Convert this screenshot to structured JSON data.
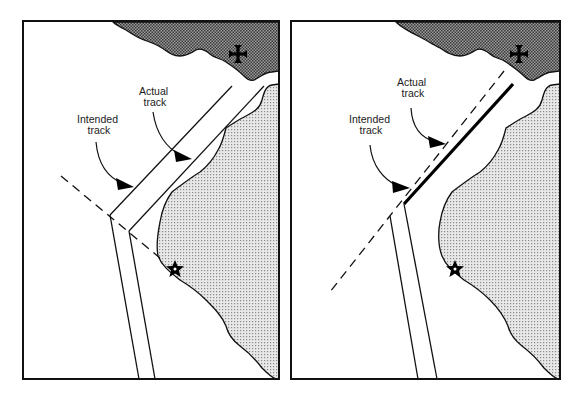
{
  "figure": {
    "panels": [
      {
        "id": "left",
        "labels": {
          "actual": [
            "Actual",
            "track"
          ],
          "intended": [
            "Intended",
            "track"
          ]
        },
        "symbols": [
          "cross-landmark",
          "star-landmark"
        ],
        "description": "Double-line channel (actual track) offset parallel to dashed intended track line"
      },
      {
        "id": "right",
        "labels": {
          "actual": [
            "Actual",
            "track"
          ],
          "intended": [
            "Intended",
            "track"
          ]
        },
        "symbols": [
          "cross-landmark",
          "star-landmark"
        ],
        "description": "Bold line (actual track) parallel to dashed intended track aligned toward cross landmark"
      }
    ],
    "colors": {
      "land_dark": "#7a7a7a",
      "land_light": "#d4d4d4",
      "line": "#111111",
      "background": "#ffffff"
    }
  }
}
